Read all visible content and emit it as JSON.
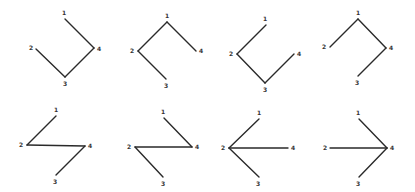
{
  "diagram": {
    "width": 415,
    "height": 192,
    "line_color": "#2a2a2a",
    "label_color": "#333333",
    "panels": [
      {
        "id": "panel-1",
        "nodes": {
          "1": {
            "x": 65,
            "y": 19,
            "lx": 64,
            "ly": 13
          },
          "2": {
            "x": 36,
            "y": 49,
            "lx": 31,
            "ly": 48
          },
          "3": {
            "x": 65,
            "y": 77,
            "lx": 65,
            "ly": 84
          },
          "4": {
            "x": 94,
            "y": 48,
            "lx": 99,
            "ly": 49
          }
        },
        "edges": [
          [
            "1",
            "4"
          ],
          [
            "4",
            "3"
          ],
          [
            "3",
            "2"
          ]
        ]
      },
      {
        "id": "panel-2",
        "nodes": {
          "1": {
            "x": 167,
            "y": 22,
            "lx": 167,
            "ly": 16
          },
          "2": {
            "x": 138,
            "y": 51,
            "lx": 132,
            "ly": 51
          },
          "3": {
            "x": 166,
            "y": 79,
            "lx": 166,
            "ly": 86
          },
          "4": {
            "x": 196,
            "y": 51,
            "lx": 201,
            "ly": 51
          }
        },
        "edges": [
          [
            "1",
            "2"
          ],
          [
            "1",
            "4"
          ],
          [
            "2",
            "3"
          ]
        ]
      },
      {
        "id": "panel-3",
        "nodes": {
          "1": {
            "x": 266,
            "y": 25,
            "lx": 265,
            "ly": 19
          },
          "2": {
            "x": 237,
            "y": 54,
            "lx": 231,
            "ly": 54
          },
          "3": {
            "x": 265,
            "y": 83,
            "lx": 265,
            "ly": 90
          },
          "4": {
            "x": 294,
            "y": 54,
            "lx": 299,
            "ly": 54
          }
        },
        "edges": [
          [
            "1",
            "2"
          ],
          [
            "2",
            "3"
          ],
          [
            "3",
            "4"
          ]
        ]
      },
      {
        "id": "panel-4",
        "nodes": {
          "1": {
            "x": 358,
            "y": 19,
            "lx": 358,
            "ly": 13
          },
          "2": {
            "x": 330,
            "y": 47,
            "lx": 324,
            "ly": 47
          },
          "3": {
            "x": 358,
            "y": 76,
            "lx": 357,
            "ly": 83
          },
          "4": {
            "x": 386,
            "y": 48,
            "lx": 391,
            "ly": 48
          }
        },
        "edges": [
          [
            "1",
            "2"
          ],
          [
            "1",
            "4"
          ],
          [
            "4",
            "3"
          ]
        ]
      },
      {
        "id": "panel-5",
        "nodes": {
          "1": {
            "x": 56,
            "y": 116,
            "lx": 56,
            "ly": 110
          },
          "2": {
            "x": 27,
            "y": 145,
            "lx": 21,
            "ly": 145
          },
          "3": {
            "x": 56,
            "y": 175,
            "lx": 55,
            "ly": 182
          },
          "4": {
            "x": 85,
            "y": 146,
            "lx": 90,
            "ly": 146
          }
        },
        "edges": [
          [
            "1",
            "2"
          ],
          [
            "2",
            "4"
          ],
          [
            "4",
            "3"
          ]
        ]
      },
      {
        "id": "panel-6",
        "nodes": {
          "1": {
            "x": 164,
            "y": 118,
            "lx": 163,
            "ly": 112
          },
          "2": {
            "x": 135,
            "y": 147,
            "lx": 129,
            "ly": 147
          },
          "3": {
            "x": 163,
            "y": 177,
            "lx": 163,
            "ly": 184
          },
          "4": {
            "x": 192,
            "y": 147,
            "lx": 197,
            "ly": 147
          }
        },
        "edges": [
          [
            "1",
            "4"
          ],
          [
            "4",
            "2"
          ],
          [
            "2",
            "3"
          ]
        ]
      },
      {
        "id": "panel-7",
        "nodes": {
          "1": {
            "x": 259,
            "y": 119,
            "lx": 259,
            "ly": 113
          },
          "2": {
            "x": 229,
            "y": 148,
            "lx": 223,
            "ly": 148
          },
          "3": {
            "x": 259,
            "y": 177,
            "lx": 258,
            "ly": 184
          },
          "4": {
            "x": 288,
            "y": 148,
            "lx": 293,
            "ly": 148
          }
        },
        "edges": [
          [
            "1",
            "2"
          ],
          [
            "2",
            "4"
          ],
          [
            "2",
            "3"
          ]
        ]
      },
      {
        "id": "panel-8",
        "nodes": {
          "1": {
            "x": 359,
            "y": 119,
            "lx": 358,
            "ly": 113
          },
          "2": {
            "x": 330,
            "y": 148,
            "lx": 325,
            "ly": 148
          },
          "3": {
            "x": 359,
            "y": 177,
            "lx": 358,
            "ly": 184
          },
          "4": {
            "x": 387,
            "y": 148,
            "lx": 392,
            "ly": 148
          }
        },
        "edges": [
          [
            "1",
            "4"
          ],
          [
            "2",
            "4"
          ],
          [
            "4",
            "3"
          ]
        ]
      }
    ]
  }
}
